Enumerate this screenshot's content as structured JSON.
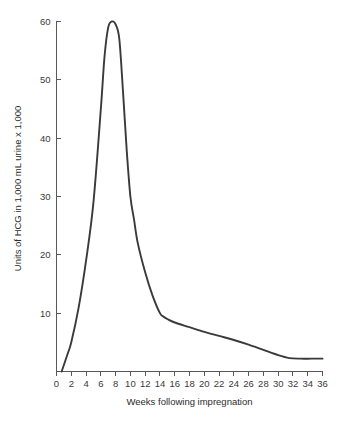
{
  "chart_data": {
    "type": "line",
    "title": "",
    "xlabel": "Weeks following impregnation",
    "ylabel": "Units of HCG in 1,000 mL urine x 1,000",
    "xlim": [
      0,
      36
    ],
    "ylim": [
      0,
      60
    ],
    "grid": false,
    "legend": null,
    "line_color": "#3a3a3a",
    "axis_color": "#585858",
    "xticks": [
      0,
      2,
      4,
      6,
      8,
      10,
      12,
      14,
      16,
      18,
      20,
      22,
      24,
      26,
      28,
      30,
      32,
      34,
      36
    ],
    "xtick_labels": [
      "0",
      "2",
      "4",
      "6",
      "8",
      "10",
      "12",
      "14",
      "16",
      "18",
      "20",
      "22",
      "24",
      "26",
      "28",
      "30",
      "32",
      "34",
      "36"
    ],
    "yticks": [
      10,
      20,
      30,
      40,
      50,
      60
    ],
    "ytick_labels": [
      "10",
      "20",
      "30",
      "40",
      "50",
      "60"
    ],
    "series": [
      {
        "name": "HCG concentration",
        "x": [
          0.7,
          1.5,
          2,
          3,
          4,
          5,
          6,
          6.5,
          7,
          7.5,
          8,
          8.5,
          9,
          9.5,
          10,
          10.5,
          11,
          12,
          13,
          14,
          14.5,
          15,
          16,
          18,
          20,
          22,
          24,
          26,
          28,
          30,
          31.5,
          33,
          34.5,
          36
        ],
        "y": [
          0,
          3,
          5,
          11,
          19,
          29,
          45,
          54,
          59,
          60,
          59.5,
          57,
          48,
          38,
          30,
          26,
          22,
          17,
          13,
          10,
          9.4,
          9,
          8.4,
          7.6,
          6.8,
          6.1,
          5.4,
          4.6,
          3.7,
          2.8,
          2.3,
          2.2,
          2.2,
          2.2
        ]
      }
    ]
  }
}
